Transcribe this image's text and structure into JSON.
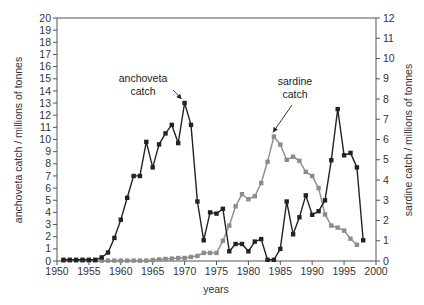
{
  "chart_data": {
    "type": "line",
    "title": "",
    "xlabel": "years",
    "ylabel": "anchoveta catch / millions of tonnes",
    "y2label": "sardine catch / millions of tonnes",
    "xlim": [
      1950,
      2000
    ],
    "ylim": [
      0,
      20
    ],
    "y2lim": [
      0,
      12
    ],
    "x_ticks": [
      1950,
      1955,
      1960,
      1965,
      1970,
      1975,
      1980,
      1985,
      1990,
      1995,
      2000
    ],
    "y_ticks": [
      0,
      1,
      2,
      3,
      4,
      5,
      6,
      7,
      8,
      9,
      10,
      11,
      12,
      13,
      14,
      15,
      16,
      17,
      18,
      19,
      20
    ],
    "y2_ticks": [
      0,
      1,
      2,
      3,
      4,
      5,
      6,
      7,
      8,
      9,
      10,
      11,
      12
    ],
    "grid": false,
    "legend": "none (inline annotations)",
    "annotations": [
      {
        "lines": [
          "anchoveta",
          "catch"
        ],
        "points_to": {
          "series": "anchoveta",
          "x": 1970,
          "y": 13.0
        }
      },
      {
        "lines": [
          "sardine",
          "catch"
        ],
        "points_to": {
          "series": "sardine",
          "x": 1984,
          "y": 6.15
        }
      }
    ],
    "series": [
      {
        "name": "anchoveta catch",
        "axis": "left",
        "color": "#222222",
        "marker": "square",
        "x": [
          1951,
          1952,
          1953,
          1954,
          1955,
          1956,
          1957,
          1958,
          1959,
          1960,
          1961,
          1962,
          1963,
          1964,
          1965,
          1966,
          1967,
          1968,
          1969,
          1970,
          1971,
          1972,
          1973,
          1974,
          1975,
          1976,
          1977,
          1978,
          1979,
          1980,
          1981,
          1982,
          1983,
          1984,
          1985,
          1986,
          1987,
          1988,
          1989,
          1990,
          1991,
          1992,
          1993,
          1994,
          1995,
          1996,
          1997,
          1998
        ],
        "values": [
          0.1,
          0.1,
          0.1,
          0.1,
          0.1,
          0.1,
          0.3,
          0.7,
          1.9,
          3.4,
          5.2,
          7.0,
          7.0,
          9.8,
          7.7,
          9.6,
          10.5,
          11.2,
          9.7,
          13.0,
          11.2,
          4.9,
          1.7,
          4.0,
          3.9,
          4.3,
          0.8,
          1.4,
          1.4,
          0.8,
          1.6,
          1.8,
          0.1,
          0.1,
          1.0,
          4.9,
          2.2,
          3.6,
          5.4,
          3.8,
          4.1,
          5.0,
          8.3,
          12.5,
          8.7,
          8.9,
          7.7,
          1.7
        ]
      },
      {
        "name": "sardine catch",
        "axis": "right",
        "color": "#8c8c8c",
        "marker": "square",
        "x": [
          1951,
          1952,
          1953,
          1954,
          1955,
          1956,
          1957,
          1958,
          1959,
          1960,
          1961,
          1962,
          1963,
          1964,
          1965,
          1966,
          1967,
          1968,
          1969,
          1970,
          1971,
          1972,
          1973,
          1974,
          1975,
          1976,
          1977,
          1978,
          1979,
          1980,
          1981,
          1982,
          1983,
          1984,
          1985,
          1986,
          1987,
          1988,
          1989,
          1990,
          1991,
          1992,
          1993,
          1994,
          1995,
          1996,
          1997
        ],
        "values": [
          0.02,
          0.02,
          0.02,
          0.02,
          0.02,
          0.02,
          0.02,
          0.02,
          0.02,
          0.02,
          0.02,
          0.02,
          0.02,
          0.02,
          0.05,
          0.08,
          0.1,
          0.12,
          0.15,
          0.15,
          0.2,
          0.25,
          0.4,
          0.4,
          0.4,
          1.0,
          1.75,
          2.7,
          3.3,
          3.05,
          3.2,
          3.85,
          4.9,
          6.15,
          5.75,
          5.0,
          5.15,
          4.95,
          4.4,
          4.2,
          3.6,
          2.3,
          1.75,
          1.65,
          1.5,
          1.1,
          0.8
        ]
      }
    ]
  }
}
